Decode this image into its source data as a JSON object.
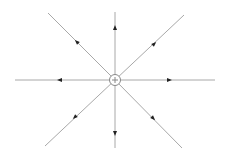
{
  "diagram": {
    "charge": {
      "sign": "+",
      "cx": 115,
      "cy": 80,
      "r": 5.5
    },
    "line_color": "#a8a8a8",
    "arrow_color": "#222222",
    "field_lines": [
      {
        "name": "up",
        "x2": 115,
        "y2": 12,
        "ax": 115,
        "ay": 28,
        "angle": -90
      },
      {
        "name": "up-right",
        "x2": 184,
        "y2": 15,
        "ax": 154,
        "ay": 44,
        "angle": -43
      },
      {
        "name": "right",
        "x2": 215,
        "y2": 80,
        "ax": 169,
        "ay": 80,
        "angle": 0
      },
      {
        "name": "down-right",
        "x2": 182,
        "y2": 148,
        "ax": 153,
        "ay": 118,
        "angle": 45
      },
      {
        "name": "down",
        "x2": 115,
        "y2": 148,
        "ax": 115,
        "ay": 133,
        "angle": 90
      },
      {
        "name": "down-left",
        "x2": 45,
        "y2": 146,
        "ax": 75,
        "ay": 117,
        "angle": 137
      },
      {
        "name": "left",
        "x2": 15,
        "y2": 80,
        "ax": 60,
        "ay": 80,
        "angle": 180
      },
      {
        "name": "up-left",
        "x2": 48,
        "y2": 13,
        "ax": 77,
        "ay": 42,
        "angle": -135
      }
    ]
  }
}
